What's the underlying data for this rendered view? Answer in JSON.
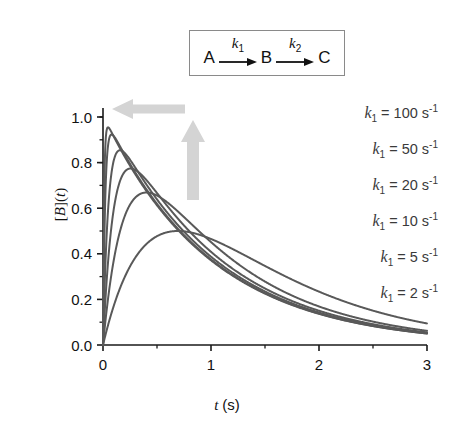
{
  "scheme": {
    "reactant": "A",
    "intermediate": "B",
    "product": "C",
    "rate1": "k",
    "rate1_sub": "1",
    "rate2": "k",
    "rate2_sub": "2",
    "arrow1_icon": "right-arrow-icon",
    "arrow2_icon": "right-arrow-icon"
  },
  "annotations": {
    "left_arrow_icon": "left-block-arrow-icon",
    "up_arrow_icon": "up-block-arrow-icon",
    "arrow_color": "#d0d0d0"
  },
  "legend": {
    "entries": [
      {
        "symbol": "k",
        "sub": "1",
        "eq": "=",
        "value": "100",
        "unit": "s",
        "exp": "-1"
      },
      {
        "symbol": "k",
        "sub": "1",
        "eq": "=",
        "value": "50",
        "unit": "s",
        "exp": "-1"
      },
      {
        "symbol": "k",
        "sub": "1",
        "eq": "=",
        "value": "20",
        "unit": "s",
        "exp": "-1"
      },
      {
        "symbol": "k",
        "sub": "1",
        "eq": "=",
        "value": "10",
        "unit": "s",
        "exp": "-1"
      },
      {
        "symbol": "k",
        "sub": "1",
        "eq": "=",
        "value": "5",
        "unit": "s",
        "exp": "-1"
      },
      {
        "symbol": "k",
        "sub": "1",
        "eq": "=",
        "value": "2",
        "unit": "s",
        "exp": "-1"
      }
    ]
  },
  "chart_data": {
    "type": "line",
    "title": "",
    "xlabel": "t (s)",
    "ylabel": "[B](t)",
    "xlim": [
      0,
      3
    ],
    "ylim": [
      0,
      1.05
    ],
    "xticks": [
      "0",
      "1",
      "2",
      "3"
    ],
    "xtick_values": [
      0,
      1,
      2,
      3
    ],
    "xminor_step": 0.5,
    "yticks": [
      "0.0",
      "0.2",
      "0.4",
      "0.6",
      "0.8",
      "1.0"
    ],
    "ytick_values": [
      0.0,
      0.2,
      0.4,
      0.6,
      0.8,
      1.0
    ],
    "yminor_step": 0.1,
    "grid": false,
    "legend_position": "upper-right-inside",
    "line_color": "#595959",
    "line_width": 2.0,
    "model": "consecutive first-order A->B->C, [B](t) = k1/(k1-k2) * (exp(-k2 t) - exp(-k1 t)), k2 = 1 s^-1",
    "k2": 1,
    "series": [
      {
        "name": "k1 = 100 s^-1",
        "k1": 100,
        "peak_t": 0.0465,
        "peak_value": 0.952,
        "x": [
          0,
          0.02,
          0.05,
          0.1,
          0.15,
          0.2,
          0.3,
          0.4,
          0.5,
          0.6,
          0.75,
          0.9,
          1.0,
          1.25,
          1.5,
          1.75,
          2.0,
          2.25,
          2.5,
          2.75,
          3.0
        ],
        "y": [
          0,
          0.844,
          0.945,
          0.908,
          0.864,
          0.823,
          0.745,
          0.674,
          0.61,
          0.552,
          0.477,
          0.411,
          0.372,
          0.289,
          0.226,
          0.176,
          0.137,
          0.106,
          0.083,
          0.065,
          0.05
        ]
      },
      {
        "name": "k1 = 50 s^-1",
        "k1": 50,
        "peak_t": 0.0799,
        "peak_value": 0.924,
        "x": [
          0,
          0.02,
          0.05,
          0.1,
          0.15,
          0.2,
          0.3,
          0.4,
          0.5,
          0.6,
          0.75,
          0.9,
          1.0,
          1.25,
          1.5,
          1.75,
          2.0,
          2.25,
          2.5,
          2.75,
          3.0
        ],
        "y": [
          0,
          0.625,
          0.868,
          0.916,
          0.878,
          0.835,
          0.756,
          0.684,
          0.619,
          0.56,
          0.482,
          0.415,
          0.376,
          0.293,
          0.228,
          0.178,
          0.138,
          0.108,
          0.084,
          0.065,
          0.051
        ]
      },
      {
        "name": "k1 = 20 s^-1",
        "k1": 20,
        "peak_t": 0.1569,
        "peak_value": 0.855,
        "x": [
          0,
          0.02,
          0.05,
          0.1,
          0.15,
          0.2,
          0.3,
          0.4,
          0.5,
          0.6,
          0.75,
          0.9,
          1.0,
          1.25,
          1.5,
          1.75,
          2.0,
          2.25,
          2.5,
          2.75,
          3.0
        ],
        "y": [
          0,
          0.326,
          0.613,
          0.81,
          0.855,
          0.843,
          0.777,
          0.705,
          0.638,
          0.577,
          0.497,
          0.428,
          0.387,
          0.302,
          0.235,
          0.183,
          0.142,
          0.111,
          0.086,
          0.067,
          0.052
        ]
      },
      {
        "name": "k1 = 10 s^-1",
        "k1": 10,
        "peak_t": 0.2441,
        "peak_value": 0.774,
        "x": [
          0,
          0.02,
          0.05,
          0.1,
          0.15,
          0.2,
          0.3,
          0.4,
          0.5,
          0.6,
          0.75,
          0.9,
          1.0,
          1.25,
          1.5,
          1.75,
          2.0,
          2.25,
          2.5,
          2.75,
          3.0
        ],
        "y": [
          0,
          0.18,
          0.385,
          0.633,
          0.723,
          0.755,
          0.748,
          0.692,
          0.631,
          0.573,
          0.494,
          0.427,
          0.387,
          0.302,
          0.236,
          0.184,
          0.143,
          0.111,
          0.087,
          0.068,
          0.053
        ]
      },
      {
        "name": "k1 = 5 s^-1",
        "k1": 5,
        "peak_t": 0.4024,
        "peak_value": 0.67,
        "x": [
          0,
          0.02,
          0.05,
          0.1,
          0.15,
          0.2,
          0.3,
          0.4,
          0.5,
          0.6,
          0.75,
          0.9,
          1.0,
          1.25,
          1.5,
          1.75,
          2.0,
          2.25,
          2.5,
          2.75,
          3.0
        ],
        "y": [
          0,
          0.094,
          0.213,
          0.375,
          0.484,
          0.556,
          0.629,
          0.651,
          0.632,
          0.589,
          0.518,
          0.45,
          0.409,
          0.32,
          0.251,
          0.196,
          0.152,
          0.119,
          0.093,
          0.072,
          0.056
        ]
      },
      {
        "name": "k1 = 2 s^-1",
        "k1": 2,
        "peak_t": 0.6931,
        "peak_value": 0.5,
        "x": [
          0,
          0.02,
          0.05,
          0.1,
          0.15,
          0.2,
          0.3,
          0.4,
          0.5,
          0.6,
          0.75,
          0.9,
          1.0,
          1.25,
          1.5,
          1.75,
          2.0,
          2.25,
          2.5,
          2.75,
          3.0
        ],
        "y": [
          0,
          0.039,
          0.093,
          0.172,
          0.24,
          0.297,
          0.392,
          0.441,
          0.477,
          0.496,
          0.5,
          0.49,
          0.465,
          0.409,
          0.347,
          0.287,
          0.234,
          0.189,
          0.151,
          0.12,
          0.095
        ]
      }
    ]
  }
}
